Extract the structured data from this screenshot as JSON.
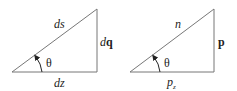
{
  "diagrams": [
    {
      "name": "differential-triangle",
      "hypotenuse": {
        "var": "ds"
      },
      "vertical": {
        "prefix": "d",
        "bold": "q"
      },
      "horizontal": {
        "var": "dz"
      },
      "angle": "θ"
    },
    {
      "name": "momentum-triangle",
      "hypotenuse": {
        "var": "n"
      },
      "vertical": {
        "bold": "p"
      },
      "horizontal": {
        "base": "p",
        "sub": "z"
      },
      "angle": "θ"
    }
  ],
  "colors": {
    "line": "#777777",
    "text": "#222222"
  }
}
